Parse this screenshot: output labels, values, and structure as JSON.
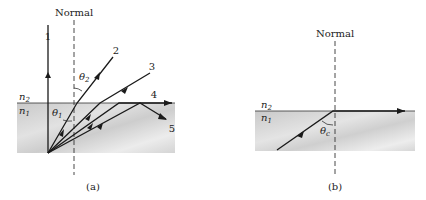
{
  "figure_a": {
    "normal_label": "Normal",
    "caption": "(a)",
    "medium_top": "n",
    "medium_top_sub": "2",
    "medium_bottom": "n",
    "medium_bottom_sub": "1",
    "angle_incident": "θ",
    "angle_incident_sub": "1",
    "angle_refracted": "θ",
    "angle_refracted_sub": "2",
    "rays": [
      {
        "label": "1",
        "description": "normal incidence, passes straight through"
      },
      {
        "label": "2",
        "description": "refracted away from normal"
      },
      {
        "label": "3",
        "description": "refracted further from normal"
      },
      {
        "label": "4",
        "description": "critical angle, refracted along interface"
      },
      {
        "label": "5",
        "description": "total internal reflection"
      }
    ]
  },
  "figure_b": {
    "normal_label": "Normal",
    "caption": "(b)",
    "medium_top": "n",
    "medium_top_sub": "2",
    "medium_bottom": "n",
    "medium_bottom_sub": "1",
    "angle_critical": "θ",
    "angle_critical_sub": "c"
  },
  "colors": {
    "ray": "#1a1a1a",
    "medium_fill_dark": "#cfcfcf",
    "medium_fill_light": "#ececec",
    "background": "#ffffff"
  }
}
